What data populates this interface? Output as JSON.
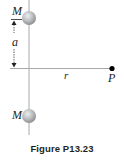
{
  "figure": {
    "caption": "Figure P13.23",
    "labels": {
      "mass_top": "M",
      "mass_bottom": "M",
      "separation": "a",
      "distance": "r",
      "point": "P"
    },
    "colors": {
      "line": "#a7a9ac",
      "sphere_fill": "#bcbec0",
      "sphere_highlight": "#e6e7e8",
      "sphere_shadow": "#939598",
      "ink": "#231f20",
      "point": "#000000"
    },
    "elements": {
      "vertical_axis": "vertical line",
      "horizontal_axis": "horizontal line",
      "dimension_arrow": "double-headed arrow"
    }
  }
}
